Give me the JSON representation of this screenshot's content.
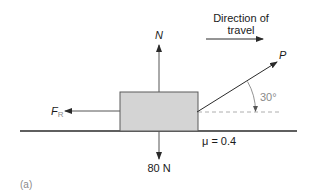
{
  "diagram": {
    "panel_label": "(a)",
    "direction": {
      "line1": "Direction of",
      "line2": "travel"
    },
    "forces": {
      "normal": "N",
      "weight": "80 N",
      "pull": "P",
      "friction_main": "F",
      "friction_sub": "R"
    },
    "angle_label": "30°",
    "friction_coefficient": "μ = 0.4",
    "pull_angle_degrees": 30,
    "colors": {
      "block_fill": "#d4d4d4",
      "block_stroke": "#5a5a5a",
      "line": "#3a3a3a",
      "dashed": "#9a9a9a",
      "angle_text": "#8a8a8a"
    }
  }
}
